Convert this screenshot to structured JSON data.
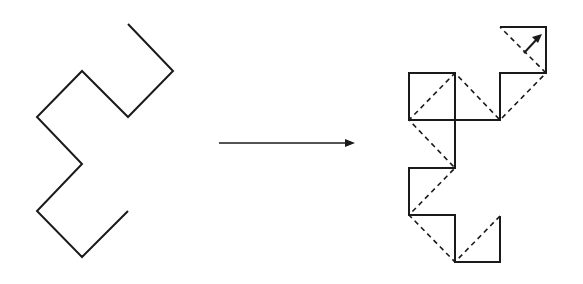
{
  "diagram": {
    "colors": {
      "stroke": "#1a1a1a",
      "background": "#ffffff"
    },
    "left_figure": {
      "label": "original-path",
      "points": "128,24 173,71 128,117 82,71 37,117 82,164 37,211 82,257 128,211",
      "stroke_width": 2
    },
    "transform_arrow": {
      "label": "transform-arrow",
      "x1": 219,
      "y1": 143,
      "x2": 347,
      "y2": 143,
      "head": "355,143 345,139 345,147",
      "stroke_width": 1.6
    },
    "right_figure": {
      "label": "next-iteration",
      "solid_points": "500,216 500,262 455,262 455,215 409,215 409,168 455,168 455,73 409,73 409,120 500,120 500,73 546,73 546,27 500,27",
      "dashed_points": "500,216 455,262 409,215 455,168 409,120 455,73 500,120 546,73 500,27",
      "solid_stroke_width": 2,
      "dashed_stroke_width": 1.6,
      "dash_pattern": "5,4",
      "direction_arrow": {
        "x1": 524,
        "y1": 53,
        "x2": 537,
        "y2": 39,
        "head": "542,34 532,37 538,43"
      }
    }
  }
}
